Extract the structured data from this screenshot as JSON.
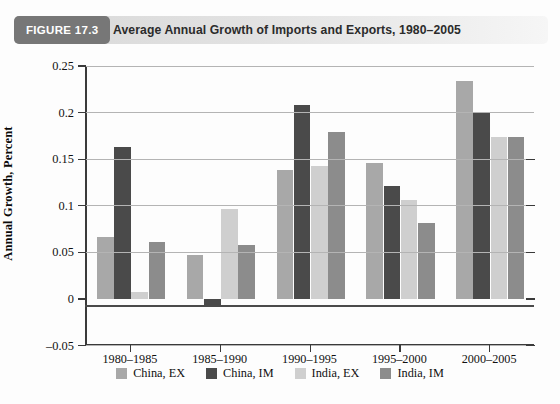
{
  "figure": {
    "badge": "FIGURE 17.3",
    "title": "Average Annual Growth of Imports and Exports, 1980–2005"
  },
  "chart_data": {
    "type": "bar",
    "title": "Average Annual Growth of Imports and Exports, 1980–2005",
    "xlabel": "",
    "ylabel": "Annual Growth, Percent",
    "categories": [
      "1980–1985",
      "1985–1990",
      "1990–1995",
      "1995–2000",
      "2000–2005"
    ],
    "series": [
      {
        "name": "China, EX",
        "color": "#a8a8a8",
        "values": [
          0.066,
          0.047,
          0.138,
          0.146,
          0.234
        ]
      },
      {
        "name": "China, IM",
        "color": "#4a4a4a",
        "values": [
          0.163,
          -0.009,
          0.208,
          0.121,
          0.2
        ]
      },
      {
        "name": "India, EX",
        "color": "#cfcfcf",
        "values": [
          0.007,
          0.097,
          0.143,
          0.106,
          0.174
        ]
      },
      {
        "name": "India, IM",
        "color": "#8c8c8c",
        "values": [
          0.061,
          0.058,
          0.179,
          0.081,
          0.174
        ]
      }
    ],
    "ylim": [
      -0.05,
      0.25
    ],
    "yticks": [
      0.25,
      0.2,
      0.15,
      0.1,
      0.05,
      0,
      -0.05
    ],
    "ytick_labels": [
      "0.25",
      "0.2",
      "0.15",
      "0.1",
      "0.05",
      "0",
      "–0.05"
    ],
    "grid": true,
    "legend_position": "bottom"
  },
  "colors": {
    "badge_bg": "#777777",
    "axis": "#3a3a3a",
    "gridline": "#b4b4b4"
  }
}
